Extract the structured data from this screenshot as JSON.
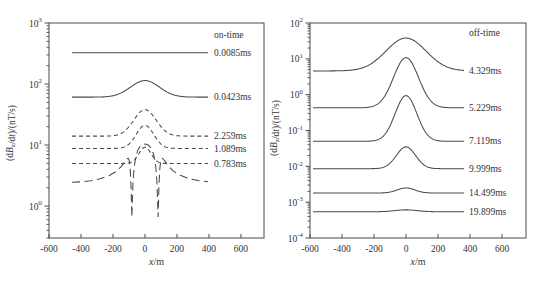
{
  "style": {
    "background": "#ffffff",
    "line_color": "#4a4a4a",
    "text_color": "#333333"
  },
  "chart_data": [
    {
      "type": "line",
      "panel": "left",
      "title": "on-time",
      "xlabel": "x/m",
      "xlabel_parts": [
        {
          "t": "x",
          "i": true
        },
        {
          "t": "/m"
        }
      ],
      "ylabel": "(dBz/dt)/(nT/s)",
      "ylabel_parts": [
        {
          "t": "(d"
        },
        {
          "t": "B",
          "i": true
        },
        {
          "t": "z",
          "sub": true
        },
        {
          "t": "/d"
        },
        {
          "t": "t",
          "i": true
        },
        {
          "t": ")/(nT/s)"
        }
      ],
      "ylog": true,
      "xlim": [
        -600,
        744
      ],
      "ylim": [
        0.3,
        1000
      ],
      "x_ticks": [
        -600,
        -400,
        -200,
        0,
        200,
        400,
        600
      ],
      "y_tick_exponents": [
        3,
        2,
        1,
        0
      ],
      "grid": false,
      "legend_position": "right-inline",
      "curve_x_extent": [
        -456,
        394
      ],
      "series": [
        {
          "label": "0.0085ms",
          "dash": "solid",
          "shape": "gaussian",
          "base": 325,
          "peak": 325,
          "sigma": 100
        },
        {
          "label": "0.0423ms",
          "dash": "solid",
          "shape": "gaussian",
          "base": 61,
          "peak": 114,
          "sigma": 90
        },
        {
          "label": "2.259ms",
          "dash": "short",
          "shape": "gaussian",
          "base": 14,
          "peak": 38,
          "sigma": 70
        },
        {
          "label": "1.089ms",
          "dash": "short",
          "shape": "gaussian",
          "base": 8.8,
          "peak": 21,
          "sigma": 55
        },
        {
          "label": "0.783ms",
          "dash": "short",
          "shape": "gaussian",
          "base": 5.0,
          "peak": 9.2,
          "sigma": 38
        },
        {
          "label": "3.879ms",
          "dash": "long",
          "shape": "points",
          "points": [
            [
              -456,
              2.45
            ],
            [
              -400,
              2.5
            ],
            [
              -340,
              2.6
            ],
            [
              -280,
              2.8
            ],
            [
              -220,
              3.2
            ],
            [
              -180,
              3.7
            ],
            [
              -150,
              4.4
            ],
            [
              -130,
              5.2
            ],
            [
              -115,
              5.9
            ],
            [
              -105,
              6.1
            ],
            [
              -98,
              5.5
            ],
            [
              -92,
              3.9
            ],
            [
              -87,
              2.0
            ],
            [
              -84,
              1.0
            ],
            [
              -82,
              0.66
            ],
            [
              -79,
              1.2
            ],
            [
              -75,
              2.4
            ],
            [
              -68,
              4.3
            ],
            [
              -58,
              6.3
            ],
            [
              -48,
              7.8
            ],
            [
              -38,
              8.9
            ],
            [
              -28,
              9.6
            ],
            [
              -18,
              10.1
            ],
            [
              -8,
              10.3
            ],
            [
              0,
              10.35
            ],
            [
              8,
              10.3
            ],
            [
              18,
              10.1
            ],
            [
              28,
              9.6
            ],
            [
              38,
              8.9
            ],
            [
              48,
              7.8
            ],
            [
              58,
              6.3
            ],
            [
              68,
              4.3
            ],
            [
              75,
              2.4
            ],
            [
              79,
              1.2
            ],
            [
              82,
              0.66
            ],
            [
              84,
              1.0
            ],
            [
              87,
              2.0
            ],
            [
              92,
              3.9
            ],
            [
              98,
              5.5
            ],
            [
              105,
              6.1
            ],
            [
              115,
              5.9
            ],
            [
              130,
              5.2
            ],
            [
              150,
              4.4
            ],
            [
              180,
              3.7
            ],
            [
              220,
              3.2
            ],
            [
              280,
              2.8
            ],
            [
              340,
              2.6
            ],
            [
              394,
              2.5
            ]
          ]
        }
      ]
    },
    {
      "type": "line",
      "panel": "right",
      "title": "off-time",
      "xlabel": "x/m",
      "xlabel_parts": [
        {
          "t": "x",
          "i": true
        },
        {
          "t": "/m"
        }
      ],
      "ylabel": "(dBz/dt)/(nT/s)",
      "ylabel_parts": [
        {
          "t": "(d"
        },
        {
          "t": "B",
          "i": true
        },
        {
          "t": "z",
          "sub": true
        },
        {
          "t": "/d"
        },
        {
          "t": "t",
          "i": true
        },
        {
          "t": ")/(nT/s)"
        }
      ],
      "ylog": true,
      "xlim": [
        -600,
        750
      ],
      "ylim": [
        0.0001,
        100
      ],
      "x_ticks": [
        -600,
        -400,
        -200,
        0,
        200,
        400,
        600
      ],
      "y_tick_exponents": [
        2,
        1,
        0,
        -1,
        -2,
        -3,
        -4
      ],
      "grid": false,
      "legend_position": "right-inline",
      "curve_x_extent": [
        -581,
        363
      ],
      "series": [
        {
          "label": "4.329ms",
          "dash": "solid",
          "shape": "gaussian",
          "base": 4.6,
          "peak": 38,
          "sigma": 125
        },
        {
          "label": "5.229ms",
          "dash": "solid",
          "shape": "gaussian",
          "base": 0.43,
          "peak": 10.8,
          "sigma": 78
        },
        {
          "label": "7.119ms",
          "dash": "solid",
          "shape": "gaussian",
          "base": 0.05,
          "peak": 0.94,
          "sigma": 68
        },
        {
          "label": "9.999ms",
          "dash": "solid",
          "shape": "gaussian",
          "base": 0.0086,
          "peak": 0.035,
          "sigma": 60
        },
        {
          "label": "14.499ms",
          "dash": "solid",
          "shape": "gaussian",
          "base": 0.0018,
          "peak": 0.0025,
          "sigma": 55
        },
        {
          "label": "19.899ms",
          "dash": "solid",
          "shape": "gaussian",
          "base": 0.00054,
          "peak": 0.00061,
          "sigma": 70
        }
      ]
    }
  ]
}
